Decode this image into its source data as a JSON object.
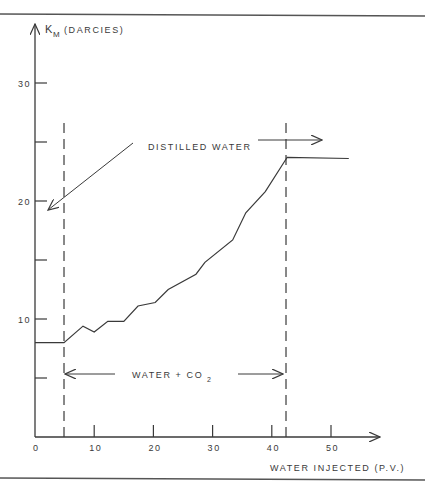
{
  "chart_data": {
    "type": "line",
    "title": "",
    "xlabel": "WATER INJECTED (P.V.)",
    "ylabel": "K_M (DARCIES)",
    "ylabel_main": "K",
    "ylabel_sub": "M",
    "ylabel_unit": "(DARCIES)",
    "xlim": [
      0,
      58
    ],
    "ylim": [
      0,
      34
    ],
    "x_ticks": [
      0,
      10,
      20,
      30,
      40,
      50
    ],
    "x_tick_labels": [
      "0",
      "10",
      "20",
      "30",
      "40",
      "50"
    ],
    "y_ticks": [
      5,
      10,
      15,
      20,
      25,
      30
    ],
    "y_tick_labels": [
      "",
      "10",
      "",
      "20",
      "",
      "30"
    ],
    "grid": false,
    "series": [
      {
        "name": "K_M",
        "x": [
          0,
          4.9,
          8.1,
          10.0,
          12.3,
          15.0,
          17.4,
          20.3,
          22.5,
          27.2,
          28.7,
          33.4,
          35.6,
          38.9,
          42.6,
          53.0
        ],
        "y": [
          8.0,
          8.0,
          9.4,
          8.9,
          9.8,
          9.8,
          11.1,
          11.4,
          12.5,
          13.8,
          14.8,
          16.7,
          19.0,
          20.8,
          23.7,
          23.6
        ]
      }
    ],
    "vertical_dashed_lines": [
      4.9,
      42.4
    ],
    "annotations": [
      {
        "text": "DISTILLED WATER",
        "note": "arrows point left to y-axis near 20 and right past x=42"
      },
      {
        "text": "WATER + CO2",
        "main": "WATER + CO",
        "sub": "2",
        "note": "double-headed span between x=5 and x=42"
      }
    ]
  }
}
